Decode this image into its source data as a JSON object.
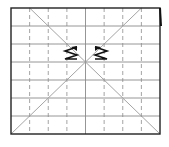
{
  "diagram": {
    "grid": {
      "columns": 8,
      "rows": 7,
      "center_column_line": "solid",
      "other_column_lines": "dashed"
    },
    "symbols": [
      {
        "name": "left-spring",
        "type": "zigzag"
      },
      {
        "name": "right-spring",
        "type": "zigzag"
      }
    ],
    "colors": {
      "frame": "#222222",
      "grid": "#8a8a8a",
      "diagonal": "#9a9a9a",
      "symbol": "#111111"
    }
  }
}
